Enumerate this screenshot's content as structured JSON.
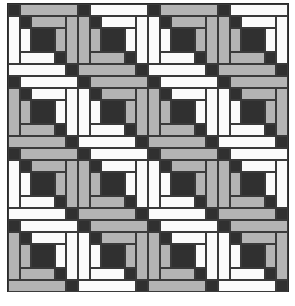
{
  "image": {
    "subject": "Log cabin quilt block pattern",
    "grid": {
      "rows": 4,
      "cols": 4
    },
    "colors": {
      "dark": "#303030",
      "gray": "#b4b4b4",
      "white": "#fbfbfb",
      "frame": "#2a2a2a"
    },
    "block_size": {
      "width": 70,
      "height": 72
    },
    "block_types": {
      "A": "top and right logs gray, left and bottom logs white",
      "B": "top and right logs white, left and bottom logs gray"
    },
    "layout": [
      [
        "A",
        "B",
        "A",
        "B"
      ],
      [
        "B",
        "A",
        "B",
        "A"
      ],
      [
        "A",
        "B",
        "A",
        "B"
      ],
      [
        "B",
        "A",
        "B",
        "A"
      ]
    ],
    "patches": [
      {
        "name": "outer-top-left-corner",
        "x": 0,
        "y": 0,
        "w": 12,
        "h": 12,
        "role": "dark"
      },
      {
        "name": "outer-top-log",
        "x": 12,
        "y": 0,
        "w": 58,
        "h": 12,
        "role": "topright"
      },
      {
        "name": "outer-right-log",
        "x": 58,
        "y": 12,
        "w": 12,
        "h": 48,
        "role": "topright"
      },
      {
        "name": "outer-left-log",
        "x": 0,
        "y": 12,
        "w": 12,
        "h": 48,
        "role": "leftbottom"
      },
      {
        "name": "outer-bottom-log",
        "x": 0,
        "y": 60,
        "w": 58,
        "h": 12,
        "role": "leftbottom"
      },
      {
        "name": "outer-bottom-right-corner",
        "x": 58,
        "y": 60,
        "w": 12,
        "h": 12,
        "role": "dark"
      },
      {
        "name": "middle-top-left-corner",
        "x": 12,
        "y": 12,
        "w": 11,
        "h": 12,
        "role": "dark"
      },
      {
        "name": "middle-top-log",
        "x": 23,
        "y": 12,
        "w": 35,
        "h": 12,
        "role": "topright"
      },
      {
        "name": "middle-right-log",
        "x": 47,
        "y": 24,
        "w": 11,
        "h": 24,
        "role": "topright"
      },
      {
        "name": "middle-left-log",
        "x": 12,
        "y": 24,
        "w": 11,
        "h": 24,
        "role": "leftbottom"
      },
      {
        "name": "middle-bottom-log",
        "x": 12,
        "y": 48,
        "w": 35,
        "h": 12,
        "role": "leftbottom"
      },
      {
        "name": "middle-bottom-right-corner",
        "x": 47,
        "y": 48,
        "w": 11,
        "h": 12,
        "role": "dark"
      },
      {
        "name": "center-square",
        "x": 23,
        "y": 24,
        "w": 24,
        "h": 24,
        "role": "dark"
      }
    ]
  }
}
